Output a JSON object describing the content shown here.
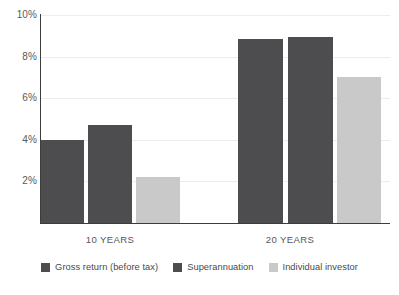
{
  "chart_data": {
    "type": "bar",
    "title": "",
    "subtitle": "",
    "xlabel": "",
    "ylabel": "",
    "categories": [
      "10 YEARS",
      "20 YEARS"
    ],
    "series": [
      {
        "name": "Gross return (before tax)",
        "color": "#4d4d4f",
        "values": [
          4.0,
          8.85
        ]
      },
      {
        "name": "Superannuation",
        "color": "#4d4d4f",
        "values": [
          4.7,
          8.95
        ]
      },
      {
        "name": "Individual investor",
        "color": "#c9c9c9",
        "values": [
          2.2,
          7.0
        ]
      }
    ],
    "ylim": [
      0,
      10
    ],
    "y_ticks": [
      2,
      4,
      6,
      8,
      10
    ],
    "y_tick_labels": [
      "2%",
      "4%",
      "6%",
      "8%",
      "10%"
    ],
    "grid": true,
    "grid_color": "#ededed",
    "axis_color": "#3c3c3c",
    "legend_position": "bottom",
    "legend": [
      {
        "label": "Gross return (before tax)",
        "color": "#4d4d4f"
      },
      {
        "label": "Superannuation",
        "color": "#4d4d4f"
      },
      {
        "label": "Individual investor",
        "color": "#c9c9c9"
      }
    ],
    "bar_geometry": {
      "group_10_years": [
        {
          "series": "Gross return (before tax)",
          "x": 41,
          "width": 43,
          "value": 4.0
        },
        {
          "series": "Superannuation",
          "x": 88,
          "width": 44,
          "value": 4.7
        },
        {
          "series": "Individual investor",
          "x": 136,
          "width": 44,
          "value": 2.2
        }
      ],
      "group_20_years": [
        {
          "series": "Gross return (before tax)",
          "x": 238,
          "width": 45,
          "value": 8.85
        },
        {
          "series": "Superannuation",
          "x": 288,
          "width": 45,
          "value": 8.95
        },
        {
          "series": "Individual investor",
          "x": 337,
          "width": 44,
          "value": 7.0
        }
      ]
    },
    "group_label_centers": [
      110,
      290
    ]
  },
  "axis": {
    "tick_10": "10%",
    "tick_8": "8%",
    "tick_6": "6%",
    "tick_4": "4%",
    "tick_2": "2%"
  },
  "groups": {
    "first": "10 YEARS",
    "second": "20 YEARS"
  },
  "legend": {
    "item1": "Gross return (before tax)",
    "item2": "Superannuation",
    "item3": "Individual investor"
  }
}
